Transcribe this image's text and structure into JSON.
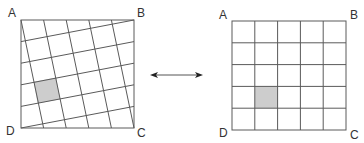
{
  "colors": {
    "line": "#5a5a5a",
    "shade": "#cdcdcd",
    "arrow": "#333333",
    "label": "#333333"
  },
  "left_figure": {
    "description": "Square ABCD with a tilted 5x5 grid inscribed",
    "labels": {
      "A": "A",
      "B": "B",
      "C": "C",
      "D": "D"
    },
    "corners": {
      "A": [
        21,
        20
      ],
      "B": [
        134,
        20
      ],
      "C": [
        134,
        128
      ],
      "D": [
        21,
        128
      ]
    },
    "grid_size": 5,
    "shaded_cell": {
      "col": 0,
      "row": 2
    }
  },
  "right_figure": {
    "description": "Square ABCD with an axis-aligned 5x5 grid",
    "labels": {
      "A": "A",
      "B": "B",
      "C": "C",
      "D": "D"
    },
    "corners": {
      "A": [
        232,
        21
      ],
      "B": [
        346,
        21
      ],
      "C": [
        346,
        130
      ],
      "D": [
        232,
        130
      ]
    },
    "grid_size": 5,
    "shaded_cell": {
      "col": 1,
      "row": 3
    }
  },
  "connector": {
    "type": "double-headed-arrow",
    "from": [
      150,
      75
    ],
    "to": [
      203,
      75
    ]
  }
}
